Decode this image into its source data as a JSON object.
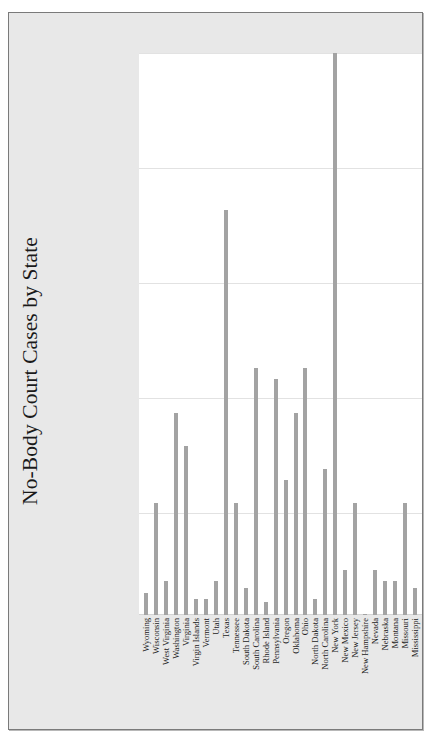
{
  "chart_data": {
    "type": "bar",
    "title": "No-Body Court Cases by State",
    "xlabel": "",
    "ylabel": "",
    "ylim": [
      0,
      25
    ],
    "yticks": [
      0,
      5,
      10,
      15,
      20,
      25
    ],
    "grid": true,
    "legend": false,
    "orientation": "vertical",
    "bar_color": "#a3a3a3",
    "background_color": "#e8e8e8",
    "plot_background_color": "#ffffff",
    "gridline_color": "#e2e2e2",
    "categories": [
      "Wyoming",
      "Wisconsin",
      "West Virginia",
      "Washington",
      "Virginia",
      "Virgin Islands",
      "Vermont",
      "Utah",
      "Texas",
      "Tennessee",
      "South Dakota",
      "South Carolina",
      "Rhode Island",
      "Pennsylvania",
      "Oregon",
      "Oklahoma",
      "Ohio",
      "North Dakota",
      "North Carolina",
      "New York",
      "New Mexico",
      "New Jersey",
      "New Hampshire",
      "Nevada",
      "Nebraska",
      "Montana",
      "Missouri",
      "Mississippi"
    ],
    "values": [
      1,
      5,
      1.5,
      9,
      7.5,
      0.7,
      0.7,
      1.5,
      18,
      5,
      1.2,
      11,
      0.6,
      10.5,
      6,
      9,
      11,
      0.7,
      6.5,
      25,
      2,
      5,
      0,
      2,
      1.5,
      1.5,
      5,
      1.2
    ],
    "ylabel_values": [
      "",
      "",
      "",
      "",
      "",
      ""
    ]
  },
  "title": {
    "text": "No-Body Court Cases by State"
  }
}
